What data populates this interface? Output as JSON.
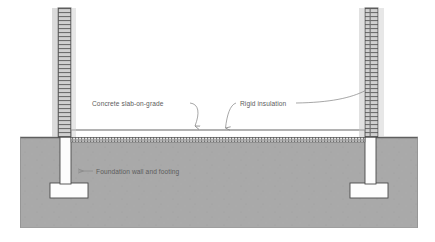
{
  "diagram": {
    "type": "architectural-section",
    "canvas": {
      "width": 435,
      "height": 242
    },
    "background_color": "#ffffff"
  },
  "colors": {
    "ground_fill": "#a9a9a9",
    "ground_edge": "#6b6b6b",
    "wall_hatch": "#6e6e6e",
    "wall_fill": "#c9c9c9",
    "below_grade_wall_fill": "#fdfdfd",
    "footing_fill": "#fdfdfd",
    "slab_fill": "#ffffff",
    "insulation_hatch": "#7a7a7a",
    "outline": "#4a4a4a",
    "leader_line": "#8a8a8a",
    "text": "#5c5c5c"
  },
  "labels": [
    {
      "id": "concrete-slab-on-grade",
      "text": "Concrete slab-on-grade",
      "x": 92,
      "y": 106,
      "anchor": "start",
      "leader": {
        "path": "M 190 103 C 199 104 200 113 196 125",
        "arrow_x": 194,
        "arrow_y": 132,
        "arrow_dir": "down"
      }
    },
    {
      "id": "rigid-insulation",
      "text": "Rigid insulation",
      "x": 240,
      "y": 106,
      "anchor": "start",
      "leader_left": {
        "path": "M 236 103 C 230 104 227 114 225 127",
        "arrow_x": 225,
        "arrow_y": 134,
        "arrow_dir": "down"
      },
      "leader_right": {
        "path": "M 296 103 C 330 102 352 98 366 91"
      }
    },
    {
      "id": "foundation-wall-and-footing",
      "text": "Foundation wall and footing",
      "x": 96,
      "y": 174,
      "anchor": "start",
      "leader": {
        "path": "M 93 171 L 78 171",
        "arrow_x": 72,
        "arrow_y": 171,
        "arrow_dir": "left"
      }
    }
  ],
  "elements": {
    "ground": {
      "name": "ground-soil-fill",
      "x": 20,
      "y": 137,
      "width": 398,
      "height": 91,
      "grade_line_y": 137
    },
    "left_wall_above": {
      "name": "left-foundation-wall-above-grade",
      "x": 58,
      "y": 8,
      "width": 13,
      "height": 129
    },
    "right_wall_above": {
      "name": "right-foundation-wall-above-grade",
      "x": 365,
      "y": 8,
      "width": 13,
      "height": 129
    },
    "left_wall_below": {
      "name": "left-foundation-wall-below-grade",
      "x": 60,
      "y": 137,
      "width": 11,
      "height": 46
    },
    "right_wall_below": {
      "name": "right-foundation-wall-below-grade",
      "x": 365,
      "y": 137,
      "width": 11,
      "height": 46
    },
    "left_footing": {
      "name": "left-footing",
      "x": 50,
      "y": 183,
      "width": 38,
      "height": 15
    },
    "right_footing": {
      "name": "right-footing",
      "x": 350,
      "y": 183,
      "width": 38,
      "height": 15
    },
    "slab": {
      "name": "concrete-slab-on-grade",
      "x": 71,
      "y": 130,
      "width": 294,
      "height": 7
    },
    "insulation": {
      "name": "rigid-insulation-layer",
      "x": 71,
      "y": 137,
      "width": 294,
      "height": 5
    }
  }
}
